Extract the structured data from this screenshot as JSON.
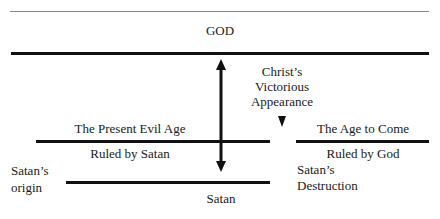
{
  "diagram": {
    "god_label": "GOD",
    "christ_label_lines": [
      "Christ’s",
      "Victorious",
      "Appearance"
    ],
    "present_age_title": "The Present Evil Age",
    "present_age_ruler": "Ruled by Satan",
    "age_to_come_title": "The Age to Come",
    "age_to_come_ruler": "Ruled by God",
    "satan_origin_lines": [
      "Satan’s",
      "origin"
    ],
    "satan_label": "Satan",
    "satan_destruction_lines": [
      "Satan’s",
      "Destruction"
    ]
  }
}
